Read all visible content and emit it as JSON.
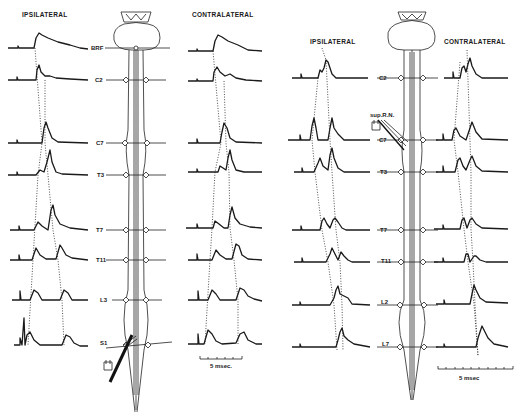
{
  "figure": {
    "type": "evoked-potential-traces",
    "panels": [
      {
        "id": "left",
        "headers": {
          "ipsilateral": "IPSILATERAL",
          "contralateral": "CONTRALATERAL"
        },
        "levels": [
          "BRF",
          "C2",
          "C7",
          "T3",
          "T7",
          "T11",
          "L3",
          "S1"
        ],
        "level_labels": {
          "BRF": "BRF",
          "C2": "C2",
          "C7": "C7",
          "T3": "T3",
          "T7": "T7",
          "T11": "T11",
          "L3": "L3",
          "S1": "S1"
        },
        "baselines_y": [
          48,
          80,
          143,
          175,
          230,
          260,
          300,
          345
        ],
        "stimulus_site": "S1",
        "scale_bar": {
          "label": "5 msec.",
          "ticks": 5
        }
      },
      {
        "id": "right",
        "headers": {
          "ipsilateral": "IPSILATERAL",
          "contralateral": "CONTRALATERAL"
        },
        "levels": [
          "C2",
          "C7",
          "T3",
          "T7",
          "T11",
          "L2",
          "L7"
        ],
        "level_labels": {
          "C2": "C2",
          "C7": "C7",
          "T3": "T3",
          "T7": "T7",
          "T11": "T11",
          "L2": "L2",
          "L7": "L7"
        },
        "baselines_y": [
          78,
          140,
          172,
          230,
          262,
          305,
          347
        ],
        "stimulus_site": "sup.R.N.",
        "stimulus_label": "sup.R.N.",
        "scale_bar": {
          "label": "5 msec",
          "ticks": 10
        }
      }
    ]
  },
  "labels": {
    "left_ipsi": "IPSILATERAL",
    "left_contra": "CONTRALATERAL",
    "right_ipsi": "IPSILATERAL",
    "right_contra": "CONTRALATERAL",
    "left_scale": "5 msec.",
    "right_scale": "5 msec",
    "sup_rn": "sup.R.N.",
    "L": {
      "brf": "BRF",
      "c2": "C2",
      "c7": "C7",
      "t3": "T3",
      "t7": "T7",
      "t11": "T11",
      "l3": "L3",
      "s1": "S1"
    },
    "R": {
      "c2": "C2",
      "c7": "C7",
      "t3": "T3",
      "t7": "T7",
      "t11": "T11",
      "l2": "L2",
      "l7": "L7"
    }
  },
  "colors": {
    "ink": "#1a1a1a",
    "paper": "#ffffff"
  }
}
